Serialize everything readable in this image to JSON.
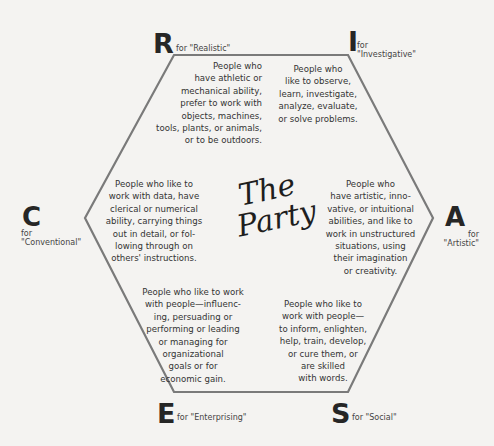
{
  "title": {
    "line1": "The",
    "line2": "Party"
  },
  "colors": {
    "background": "#f4f3f1",
    "hexagon_stroke": "#7a7a7a",
    "text": "#333333"
  },
  "types": {
    "R": {
      "letter": "R",
      "sub": "for \"Realistic\"",
      "desc": "People who\nhave athletic or\nmechanical ability,\nprefer to work with\nobjects, machines,\ntools, plants, or animals,\nor to be outdoors."
    },
    "I": {
      "letter": "I",
      "sub_line1": "for",
      "sub_line2": "\"Investigative\"",
      "desc": "People who\nlike to observe,\nlearn, investigate,\nanalyze, evaluate,\nor solve problems."
    },
    "A": {
      "letter": "A",
      "sub_line1": "for",
      "sub_line2": "\"Artistic\"",
      "desc": "People who\nhave artistic, inno-\nvative, or intuitional\nabilities, and like to\nwork in unstructured\nsituations, using\ntheir imagination\nor creativity."
    },
    "S": {
      "letter": "S",
      "sub": "for \"Social\"",
      "desc": "People who like to\nwork with people—\nto inform, enlighten,\nhelp, train, develop,\nor cure them, or\nare skilled\nwith words."
    },
    "E": {
      "letter": "E",
      "sub": "for \"Enterprising\"",
      "desc": "People who like to work\nwith people—influenc-\ning, persuading or\nperforming or leading\nor managing for\norganizational\ngoals or for\neconomic gain."
    },
    "C": {
      "letter": "C",
      "sub_line1": "for",
      "sub_line2": "\"Conventional\"",
      "desc": "People who like to\nwork with data, have\nclerical or numerical\nability, carrying things\nout in detail, or fol-\nlowing through on\nothers' instructions."
    }
  }
}
